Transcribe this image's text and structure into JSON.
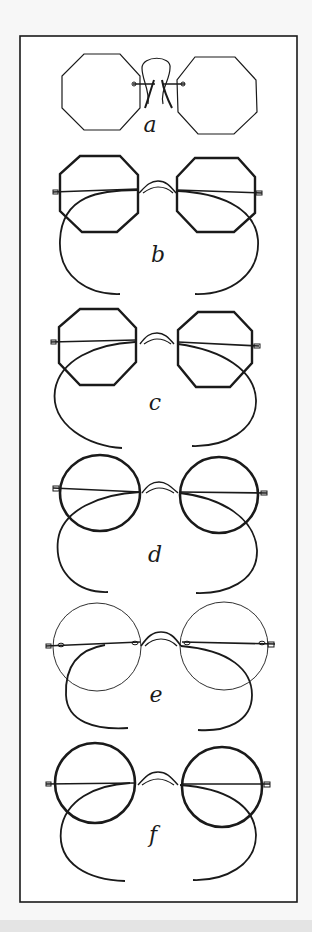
{
  "figure": {
    "background": "#f7f7f7",
    "frame_color": "#1a1a1a",
    "ink_color": "#1a1a1a",
    "panels": [
      {
        "id": "a",
        "label": "a",
        "style": "pince-nez",
        "lens_shape": "octagon"
      },
      {
        "id": "b",
        "label": "b",
        "style": "spectacles-cable-temples",
        "lens_shape": "octagon"
      },
      {
        "id": "c",
        "label": "c",
        "style": "spectacles-cable-temples",
        "lens_shape": "octagon"
      },
      {
        "id": "d",
        "label": "d",
        "style": "spectacles-cable-temples",
        "lens_shape": "round"
      },
      {
        "id": "e",
        "label": "e",
        "style": "rimless-cable-temples",
        "lens_shape": "round"
      },
      {
        "id": "f",
        "label": "f",
        "style": "spectacles-cable-temples",
        "lens_shape": "round"
      }
    ]
  }
}
